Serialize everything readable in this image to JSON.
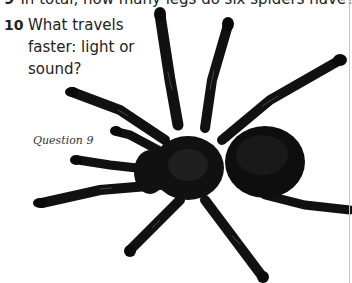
{
  "questions": [
    {
      "number": "9",
      "text": "In total, how many legs do six spiders have?",
      "cropped": true
    },
    {
      "number": "10",
      "lines": [
        "What travels",
        "faster: light or",
        "sound?"
      ]
    }
  ],
  "image": {
    "subject": "tarantula-spider",
    "caption": "Question 9"
  },
  "colors": {
    "background": "#ffffff",
    "text": "#222222",
    "spider": "#111111",
    "spider_highlight": "#4a4a4a"
  }
}
